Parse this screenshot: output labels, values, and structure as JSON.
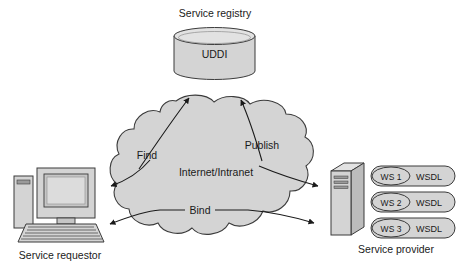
{
  "diagram": {
    "colors": {
      "shape_fill": "#d4d4d4",
      "shape_fill_light": "#e2e2e2",
      "shape_fill_dark": "#bcbcbc",
      "stroke": "#3b3b3b",
      "text": "#1a1a1a",
      "background": "#ffffff"
    },
    "registry": {
      "caption": "Service registry",
      "cylinder_label": "UDDI"
    },
    "requestor": {
      "caption": "Service requestor"
    },
    "provider": {
      "caption": "Service provider",
      "services": [
        {
          "ws_label": "WS 1",
          "wsdl_label": "WSDL"
        },
        {
          "ws_label": "WS 2",
          "wsdl_label": "WSDL"
        },
        {
          "ws_label": "WS 3",
          "wsdl_label": "WSDL"
        }
      ]
    },
    "network": {
      "label": "Internet/Intranet",
      "operations": [
        {
          "name": "find",
          "label": "Find"
        },
        {
          "name": "publish",
          "label": "Publish"
        },
        {
          "name": "bind",
          "label": "Bind"
        }
      ]
    }
  }
}
